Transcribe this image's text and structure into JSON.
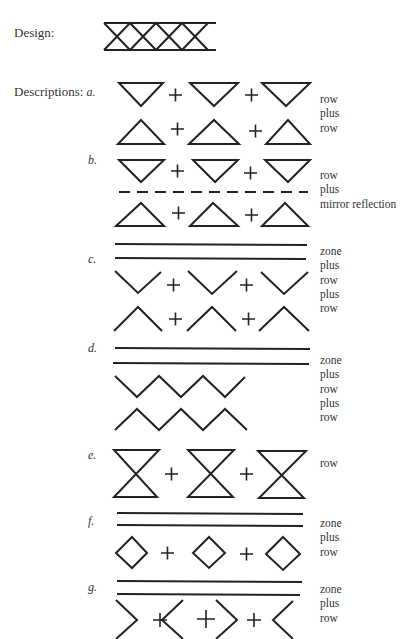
{
  "design": {
    "label": "Design:"
  },
  "descriptions_label": "Descriptions:",
  "sections": [
    {
      "letter": "a.",
      "terms": [
        "row",
        "plus",
        "row"
      ]
    },
    {
      "letter": "b.",
      "terms": [
        "row",
        "plus",
        "mirror reflection"
      ]
    },
    {
      "letter": "c.",
      "terms": [
        "zone",
        "plus",
        "row",
        "plus",
        "row"
      ]
    },
    {
      "letter": "d.",
      "terms": [
        "zone",
        "plus",
        "row",
        "plus",
        "row"
      ]
    },
    {
      "letter": "e.",
      "terms": [
        "row"
      ]
    },
    {
      "letter": "f.",
      "terms": [
        "zone",
        "plus",
        "row"
      ]
    },
    {
      "letter": "g.",
      "terms": [
        "zone",
        "plus",
        "row"
      ]
    }
  ]
}
